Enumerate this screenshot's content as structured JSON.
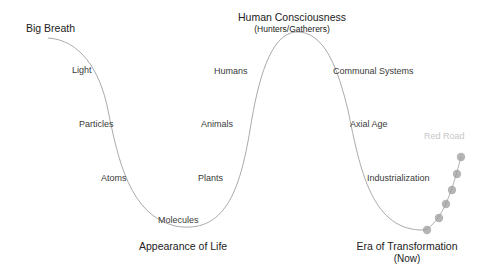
{
  "diagram": {
    "labels": {
      "big_breath": "Big Breath",
      "light": "Light",
      "particles": "Particles",
      "atoms": "Atoms",
      "molecules": "Molecules",
      "appearance_of_life": "Appearance of Life",
      "plants": "Plants",
      "animals": "Animals",
      "humans": "Humans",
      "human_consciousness": "Human Consciousness",
      "human_consciousness_sub": "(Hunters/Gatherers)",
      "communal_systems": "Communal Systems",
      "axial_age": "Axial Age",
      "industrialization": "Industrialization",
      "era_of_transformation": "Era of Transformation",
      "era_of_transformation_sub": "(Now)",
      "red_road": "Red Road"
    },
    "colors": {
      "curve": "#999999",
      "dots": "#aaaaaa",
      "faint_text": "#c8c8c8"
    }
  }
}
